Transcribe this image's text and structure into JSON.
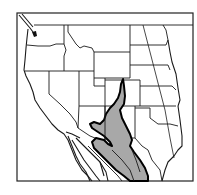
{
  "map": {
    "region": "Western United States and northern Mexico",
    "features": {
      "state_borders": true,
      "shaded_range": {
        "fill_color": "#a8a8a8",
        "outline_color": "#000000",
        "description": "Shaded distribution range extending from southern Colorado south through New Mexico into Mexico"
      },
      "frame": true
    },
    "colors": {
      "background": "#ffffff",
      "lines": "#1a1a1a",
      "range_fill": "#a8a8a8"
    }
  }
}
